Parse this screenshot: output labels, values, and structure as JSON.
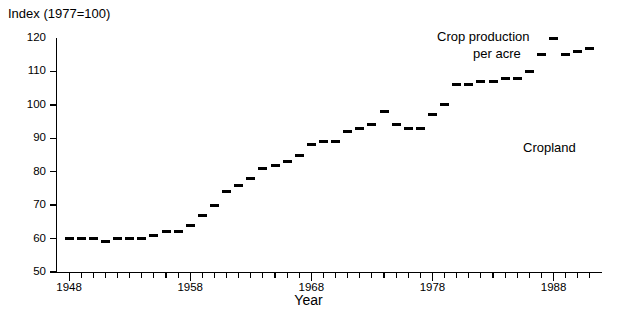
{
  "chart_data": {
    "type": "scatter",
    "title": "Index (1977=100)",
    "xlabel": "Year",
    "ylabel": "Index (1977=100)",
    "ylim": [
      50,
      120
    ],
    "xlim": [
      1947,
      1992
    ],
    "ytick_values": [
      50,
      60,
      70,
      80,
      90,
      100,
      110,
      120
    ],
    "ytick_labels": [
      "50",
      "60",
      "70",
      "80",
      "90",
      "100",
      "110",
      "120"
    ],
    "xtick_values": [
      1948,
      1958,
      1968,
      1978,
      1988
    ],
    "xtick_labels": [
      "1948",
      "1958",
      "1968",
      "1978",
      "1988"
    ],
    "grid": false,
    "legend": "none",
    "marker_style": "horizontal-dash",
    "series": [
      {
        "name": "Crop production per acre",
        "x": [
          1948,
          1949,
          1950,
          1951,
          1952,
          1953,
          1954,
          1955,
          1956,
          1957,
          1958,
          1959,
          1960,
          1961,
          1962,
          1963,
          1964,
          1965,
          1966,
          1967,
          1968,
          1969,
          1970,
          1971,
          1972,
          1973,
          1974,
          1975,
          1976,
          1977,
          1978,
          1979,
          1980,
          1981,
          1982,
          1983,
          1984,
          1985,
          1986,
          1987,
          1988,
          1989,
          1990,
          1991
        ],
        "values": [
          60,
          60,
          60,
          59,
          60,
          60,
          60,
          61,
          62,
          62,
          64,
          67,
          70,
          74,
          76,
          78,
          81,
          82,
          83,
          85,
          88,
          89,
          89,
          92,
          93,
          94,
          98,
          94,
          93,
          93,
          97,
          100,
          106,
          106,
          107,
          107,
          108,
          108,
          110,
          115,
          120,
          115,
          116,
          117
        ]
      }
    ],
    "annotations": [
      {
        "name": "crop-production-label",
        "text_line1": "Crop production",
        "text_line2": "per acre"
      },
      {
        "name": "cropland-label",
        "text": "Cropland"
      }
    ]
  },
  "labels": {
    "index_title": "Index (1977=100)",
    "xaxis_title": "Year",
    "annot_crop_line1": "Crop production",
    "annot_crop_line2": "per acre",
    "annot_cropland": "Cropland"
  }
}
